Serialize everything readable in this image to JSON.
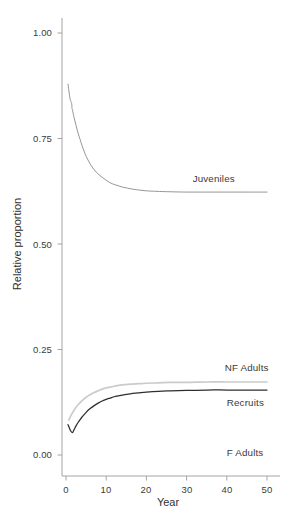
{
  "chart_data": {
    "type": "line",
    "title": "",
    "xlabel": "Year",
    "ylabel": "Relative proportion",
    "xlim": [
      0,
      51
    ],
    "ylim": [
      0.0,
      1.05
    ],
    "xticks": [
      0,
      10,
      20,
      30,
      40,
      50
    ],
    "xtick_labels": [
      "0",
      "10",
      "20",
      "30",
      "40",
      "50"
    ],
    "yticks": [
      0.0,
      0.25,
      0.5,
      0.75,
      1.0
    ],
    "ytick_labels": [
      "0.00",
      "0.25",
      "0.50",
      "0.75",
      "1.00"
    ],
    "grid": false,
    "legend_position": "inline-right-annotations",
    "series": [
      {
        "name": "Juveniles",
        "color": "#8f8f8f",
        "label_x": 31.5,
        "label_y": 0.655,
        "x": [
          0.5,
          1.0,
          1.4,
          1.5,
          1.6,
          2.0,
          2.5,
          3.0,
          3.5,
          4.0,
          4.5,
          5.0,
          6.0,
          7.0,
          8.0,
          9.0,
          10.0,
          11.0,
          12.0,
          13.0,
          14.0,
          15.0,
          16.0,
          18.0,
          20.0,
          22.0,
          25.0,
          30.0,
          35.0,
          40.0,
          45.0,
          50.0
        ],
        "y": [
          0.879,
          0.845,
          0.833,
          0.821,
          0.818,
          0.8,
          0.781,
          0.763,
          0.748,
          0.733,
          0.72,
          0.708,
          0.69,
          0.676,
          0.666,
          0.658,
          0.651,
          0.645,
          0.641,
          0.638,
          0.635,
          0.633,
          0.631,
          0.628,
          0.626,
          0.625,
          0.624,
          0.623,
          0.623,
          0.623,
          0.623,
          0.623
        ]
      },
      {
        "name": "NF Adults",
        "color": "#cbcbcb",
        "label_x": 39.5,
        "label_y": 0.206,
        "x": [
          0.7,
          1.0,
          1.5,
          2.0,
          2.5,
          3.0,
          3.5,
          4.0,
          5.0,
          6.0,
          7.0,
          8.0,
          9.0,
          10.0,
          11.0,
          12.0,
          13.0,
          14.0,
          16.0,
          18.0,
          20.0,
          23.0,
          26.0,
          30.0,
          35.0,
          40.0,
          45.0,
          50.0
        ],
        "y": [
          0.083,
          0.089,
          0.098,
          0.106,
          0.113,
          0.119,
          0.124,
          0.129,
          0.137,
          0.143,
          0.148,
          0.152,
          0.156,
          0.159,
          0.161,
          0.163,
          0.165,
          0.166,
          0.168,
          0.169,
          0.17,
          0.171,
          0.172,
          0.172,
          0.173,
          0.173,
          0.173,
          0.173
        ]
      },
      {
        "name": "Recruits",
        "color": "#2e2e2e",
        "label_x": 40.0,
        "label_y": 0.123,
        "x": [
          0.5,
          1.1,
          1.6,
          2.0,
          2.5,
          3.0,
          3.5,
          4.0,
          5.0,
          6.0,
          7.0,
          8.0,
          9.0,
          10.0,
          11.0,
          12.0,
          13.0,
          14.0,
          16.0,
          18.0,
          20.0,
          23.0,
          26.0,
          30.0,
          35.0,
          40.0,
          45.0,
          50.0
        ],
        "y": [
          0.072,
          0.058,
          0.053,
          0.06,
          0.069,
          0.077,
          0.084,
          0.09,
          0.101,
          0.11,
          0.117,
          0.123,
          0.128,
          0.132,
          0.135,
          0.138,
          0.14,
          0.142,
          0.145,
          0.147,
          0.149,
          0.151,
          0.152,
          0.153,
          0.154,
          0.154,
          0.154,
          0.154
        ]
      },
      {
        "name": "F Adults",
        "color": "#2e2e2e",
        "label_x": 40.0,
        "label_y": 0.005,
        "x": [],
        "y": []
      }
    ]
  },
  "axes": {
    "y_title": "Relative proportion",
    "x_title": "Year",
    "y_tick_labels": [
      "1.00",
      "0.75",
      "0.50",
      "0.25",
      "0.00"
    ],
    "x_tick_labels": [
      "0",
      "10",
      "20",
      "30",
      "40",
      "50"
    ]
  },
  "annotations": {
    "juveniles": "Juveniles",
    "nf_adults": "NF Adults",
    "recruits": "Recruits",
    "f_adults": "F Adults"
  },
  "colors": {
    "juveniles_line": "#8f8f8f",
    "nf_adults_line": "#cbcbcb",
    "recruits_line": "#2e2e2e",
    "axis": "#9a9a9a",
    "text": "#3a3a3a",
    "background": "#ffffff"
  }
}
